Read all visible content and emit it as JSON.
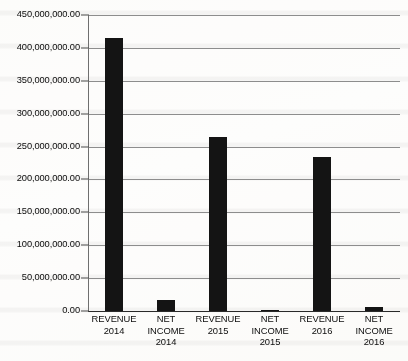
{
  "chart_data": {
    "type": "bar",
    "title": "",
    "subtitle": "",
    "xlabel": "",
    "ylabel": "",
    "ylim": [
      0,
      450000000
    ],
    "grid": true,
    "legend": false,
    "legend_position": "none",
    "orientation": "vertical",
    "bar_color": "#141414",
    "categories": [
      "REVENUE 2014",
      "NET INCOME 2014",
      "REVENUE 2015",
      "NET INCOME 2015",
      "REVENUE 2016",
      "NET INCOME 2016"
    ],
    "category_lines": [
      [
        "REVENUE",
        "2014"
      ],
      [
        "NET",
        "INCOME",
        "2014"
      ],
      [
        "REVENUE",
        "2015"
      ],
      [
        "NET",
        "INCOME",
        "2015"
      ],
      [
        "REVENUE",
        "2016"
      ],
      [
        "NET",
        "INCOME",
        "2016"
      ]
    ],
    "values": [
      415000000,
      16700000,
      264500000,
      1500000,
      234000000,
      6000000
    ],
    "ytick_values": [
      0,
      50000000,
      100000000,
      150000000,
      200000000,
      250000000,
      300000000,
      350000000,
      400000000,
      450000000
    ],
    "ytick_labels": [
      "0.00",
      "50,000,000.00",
      "100,000,000.00",
      "150,000,000.00",
      "200,000,000.00",
      "250,000,000.00",
      "300,000,000.00",
      "350,000,000.00",
      "400,000,000.00",
      "450,000,000.00"
    ],
    "colors": {
      "bar": "#141414",
      "gridline": "#8d8d8d",
      "axis": "#2a2a2a",
      "text": "#0d0d0d",
      "background": "#fdfcfa"
    }
  }
}
